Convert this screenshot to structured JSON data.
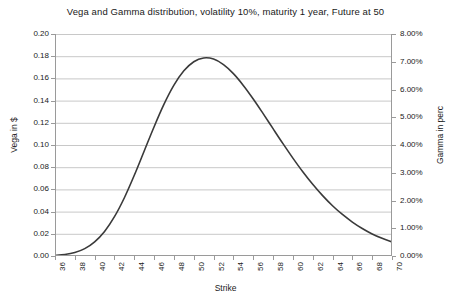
{
  "chart_data": {
    "type": "line",
    "title": "Vega and Gamma distribution, volatility 10%, maturity 1 year, Future at 50",
    "xlabel": "Strike",
    "ylabel": "Vega in $",
    "ylabel_right": "Gamma in perc",
    "xlim": [
      36,
      70
    ],
    "ylim": [
      0.0,
      0.2
    ],
    "ylim_right": [
      0.0,
      0.08
    ],
    "grid": true,
    "legend": "none",
    "xticks": [
      36,
      38,
      40,
      42,
      44,
      46,
      48,
      50,
      52,
      54,
      56,
      58,
      60,
      62,
      64,
      66,
      68,
      70
    ],
    "xtick_labels": [
      "36",
      "38",
      "40",
      "42",
      "44",
      "46",
      "48",
      "50",
      "52",
      "54",
      "56",
      "58",
      "60",
      "62",
      "64",
      "66",
      "68",
      "70"
    ],
    "yticks": [
      0.0,
      0.02,
      0.04,
      0.06,
      0.08,
      0.1,
      0.12,
      0.14,
      0.16,
      0.18,
      0.2
    ],
    "ytick_labels": [
      "0.00",
      "0.02",
      "0.04",
      "0.06",
      "0.08",
      "0.10",
      "0.12",
      "0.14",
      "0.16",
      "0.18",
      "0.20"
    ],
    "yticks_right": [
      0.0,
      0.01,
      0.02,
      0.03,
      0.04,
      0.05,
      0.06,
      0.07,
      0.08
    ],
    "ytick_labels_right": [
      "0.00%",
      "1.00%",
      "2.00%",
      "3.00%",
      "4.00%",
      "5.00%",
      "6.00%",
      "7.00%",
      "8.00%"
    ],
    "line_color": "#3a3a3a",
    "grid_color": "#c8c8c8",
    "axis_color": "#9a9a9a",
    "series": [
      {
        "name": "Vega / Gamma distribution",
        "x": [
          36,
          37,
          38,
          39,
          40,
          41,
          42,
          43,
          44,
          45,
          46,
          47,
          48,
          49,
          50,
          51,
          52,
          53,
          54,
          55,
          56,
          57,
          58,
          59,
          60,
          61,
          62,
          63,
          64,
          65,
          66,
          67,
          68,
          69,
          70
        ],
        "values": [
          0.0005,
          0.0013,
          0.0031,
          0.0066,
          0.0127,
          0.0221,
          0.0354,
          0.0525,
          0.0727,
          0.0946,
          0.1165,
          0.1368,
          0.1539,
          0.1668,
          0.175,
          0.1784,
          0.1774,
          0.1724,
          0.1643,
          0.1537,
          0.1415,
          0.1283,
          0.1147,
          0.1012,
          0.0882,
          0.0759,
          0.0646,
          0.0544,
          0.0453,
          0.0374,
          0.0306,
          0.0248,
          0.0199,
          0.0159,
          0.0126
        ]
      }
    ]
  }
}
